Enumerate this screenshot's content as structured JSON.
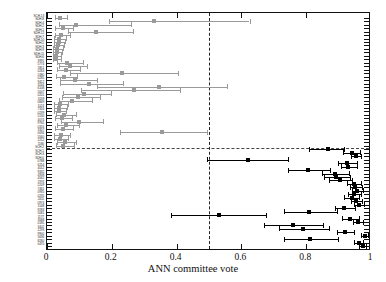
{
  "figure": {
    "xaxis": {
      "label": "ANN committee vote",
      "ticks": [
        "0",
        "0.2",
        "0.4",
        "0.6",
        "0.8",
        "1"
      ],
      "tick_values": [
        0,
        0.2,
        0.4,
        0.6,
        0.8,
        1.0
      ],
      "min": 0,
      "max": 1
    },
    "decision_threshold": 0.5,
    "group_split_fraction": 0.215,
    "colors": {
      "rejected_marker": "#9a9a9a",
      "accepted_marker": "#000000",
      "axis": "#111111",
      "reference_line": "#222222"
    }
  },
  "chart_data": {
    "type": "scatter",
    "title": "",
    "xlabel": "ANN committee vote",
    "ylabel": "",
    "xlim": [
      0,
      1
    ],
    "grid": false,
    "legend": "none",
    "orientation": "horizontal-forest",
    "annotations": [
      {
        "type": "vline",
        "x": 0.5,
        "style": "dashed",
        "label": "decision threshold"
      },
      {
        "type": "hline",
        "y_index": 13,
        "style": "dashed",
        "label": "group separator"
      }
    ],
    "series": [
      {
        "name": "Low vote (gray)",
        "color": "#9a9a9a",
        "marker": "square",
        "points": [
          {
            "label": "SCH-13",
            "x": 0.04,
            "xerr_low": 0.016,
            "xerr_high": 0.022
          },
          {
            "label": "SDH-8",
            "x": 0.33,
            "xerr_low": 0.14,
            "xerr_high": 0.295
          },
          {
            "label": "SDH-4",
            "x": 0.088,
            "xerr_low": 0.052,
            "xerr_high": 0.17
          },
          {
            "label": "SDH-2",
            "x": 0.05,
            "xerr_low": 0.026,
            "xerr_high": 0.03
          },
          {
            "label": "SDH-1",
            "x": 0.15,
            "xerr_low": 0.085,
            "xerr_high": 0.115
          },
          {
            "label": "SDH-12",
            "x": 0.044,
            "xerr_low": 0.02,
            "xerr_high": 0.026
          },
          {
            "label": "SDH-7",
            "x": 0.038,
            "xerr_low": 0.015,
            "xerr_high": 0.02
          },
          {
            "label": "SDH-10",
            "x": 0.036,
            "xerr_low": 0.014,
            "xerr_high": 0.019
          },
          {
            "label": "SDH-5",
            "x": 0.034,
            "xerr_low": 0.013,
            "xerr_high": 0.018
          },
          {
            "label": "SDH-3",
            "x": 0.032,
            "xerr_low": 0.012,
            "xerr_high": 0.017
          },
          {
            "label": "SDH-9",
            "x": 0.03,
            "xerr_low": 0.012,
            "xerr_high": 0.016
          },
          {
            "label": "SDH-11",
            "x": 0.029,
            "xerr_low": 0.011,
            "xerr_high": 0.015
          },
          {
            "label": "SDH-6",
            "x": 0.028,
            "xerr_low": 0.011,
            "xerr_high": 0.015
          },
          {
            "label": "3991",
            "x": 0.062,
            "xerr_low": 0.03,
            "xerr_high": 0.048
          },
          {
            "label": "5774",
            "x": 0.07,
            "xerr_low": 0.034,
            "xerr_high": 0.052
          },
          {
            "label": "1851",
            "x": 0.058,
            "xerr_low": 0.028,
            "xerr_high": 0.044
          },
          {
            "label": "0263",
            "x": 0.23,
            "xerr_low": 0.16,
            "xerr_high": 0.175
          },
          {
            "label": "2480",
            "x": 0.054,
            "xerr_low": 0.026,
            "xerr_high": 0.04
          },
          {
            "label": "0285",
            "x": 0.085,
            "xerr_low": 0.046,
            "xerr_high": 0.07
          },
          {
            "label": "9412",
            "x": 0.13,
            "xerr_low": 0.09,
            "xerr_high": 0.105
          },
          {
            "label": "3244",
            "x": 0.345,
            "xerr_low": 0.19,
            "xerr_high": 0.21
          },
          {
            "label": "6108",
            "x": 0.27,
            "xerr_low": 0.165,
            "xerr_high": 0.14
          },
          {
            "label": "5007",
            "x": 0.115,
            "xerr_low": 0.065,
            "xerr_high": 0.082
          },
          {
            "label": "0201",
            "x": 0.095,
            "xerr_low": 0.05,
            "xerr_high": 0.07
          },
          {
            "label": "1059",
            "x": 0.078,
            "xerr_low": 0.04,
            "xerr_high": 0.062
          },
          {
            "label": "0849",
            "x": 0.04,
            "xerr_low": 0.018,
            "xerr_high": 0.026
          },
          {
            "label": "1024",
            "x": 0.038,
            "xerr_low": 0.016,
            "xerr_high": 0.024
          },
          {
            "label": "7316",
            "x": 0.036,
            "xerr_low": 0.015,
            "xerr_high": 0.022
          },
          {
            "label": "0239",
            "x": 0.052,
            "xerr_low": 0.024,
            "xerr_high": 0.036
          },
          {
            "label": "5130",
            "x": 0.046,
            "xerr_low": 0.021,
            "xerr_high": 0.03
          },
          {
            "label": "4074",
            "x": 0.1,
            "xerr_low": 0.056,
            "xerr_high": 0.074
          },
          {
            "label": "9765",
            "x": 0.058,
            "xerr_low": 0.027,
            "xerr_high": 0.04
          },
          {
            "label": "0316",
            "x": 0.048,
            "xerr_low": 0.022,
            "xerr_high": 0.032
          },
          {
            "label": "3357",
            "x": 0.355,
            "xerr_low": 0.13,
            "xerr_high": 0.14
          },
          {
            "label": "0094",
            "x": 0.042,
            "xerr_low": 0.019,
            "xerr_high": 0.028
          },
          {
            "label": "5560",
            "x": 0.04,
            "xerr_low": 0.018,
            "xerr_high": 0.026
          },
          {
            "label": "2212",
            "x": 0.055,
            "xerr_low": 0.025,
            "xerr_high": 0.036
          },
          {
            "label": "1180",
            "x": 0.05,
            "xerr_low": 0.023,
            "xerr_high": 0.032
          }
        ]
      },
      {
        "name": "High vote (black)",
        "color": "#000000",
        "marker": "square",
        "points": [
          {
            "label": "SCH-2",
            "x": 0.868,
            "xerr_low": 0.058,
            "xerr_high": 0.05
          },
          {
            "label": "SCH-1",
            "x": 0.942,
            "xerr_low": 0.028,
            "xerr_high": 0.024
          },
          {
            "label": "SCH-3",
            "x": 0.955,
            "xerr_low": 0.018,
            "xerr_high": 0.015
          },
          {
            "label": "SDH-0",
            "x": 0.62,
            "xerr_low": 0.125,
            "xerr_high": 0.125
          },
          {
            "label": "0788",
            "x": 0.926,
            "xerr_low": 0.028,
            "xerr_high": 0.03
          },
          {
            "label": "6254",
            "x": 0.93,
            "xerr_low": 0.024,
            "xerr_high": 0.026
          },
          {
            "label": "4012",
            "x": 0.805,
            "xerr_low": 0.06,
            "xerr_high": 0.068
          },
          {
            "label": "9332",
            "x": 0.888,
            "xerr_low": 0.04,
            "xerr_high": 0.044
          },
          {
            "label": "4908",
            "x": 0.892,
            "xerr_low": 0.038,
            "xerr_high": 0.042
          },
          {
            "label": "4562",
            "x": 0.905,
            "xerr_low": 0.034,
            "xerr_high": 0.036
          },
          {
            "label": "1976",
            "x": 0.946,
            "xerr_low": 0.02,
            "xerr_high": 0.022
          },
          {
            "label": "2209",
            "x": 0.952,
            "xerr_low": 0.018,
            "xerr_high": 0.019
          },
          {
            "label": "7461",
            "x": 0.958,
            "xerr_low": 0.016,
            "xerr_high": 0.017
          },
          {
            "label": "0935",
            "x": 0.948,
            "xerr_low": 0.019,
            "xerr_high": 0.021
          },
          {
            "label": "0235",
            "x": 0.94,
            "xerr_low": 0.022,
            "xerr_high": 0.024
          },
          {
            "label": "2411",
            "x": 0.955,
            "xerr_low": 0.017,
            "xerr_high": 0.018
          },
          {
            "label": "0974",
            "x": 0.962,
            "xerr_low": 0.014,
            "xerr_high": 0.015
          },
          {
            "label": "1548",
            "x": 0.918,
            "xerr_low": 0.03,
            "xerr_high": 0.032
          },
          {
            "label": "9283",
            "x": 0.81,
            "xerr_low": 0.08,
            "xerr_high": 0.085
          },
          {
            "label": "5081",
            "x": 0.532,
            "xerr_low": 0.15,
            "xerr_high": 0.145
          },
          {
            "label": "1177",
            "x": 0.935,
            "xerr_low": 0.026,
            "xerr_high": 0.027
          },
          {
            "label": "3068",
            "x": 0.96,
            "xerr_low": 0.015,
            "xerr_high": 0.016
          },
          {
            "label": "0185",
            "x": 0.76,
            "xerr_low": 0.09,
            "xerr_high": 0.092
          },
          {
            "label": "3402",
            "x": 0.79,
            "xerr_low": 0.075,
            "xerr_high": 0.08
          },
          {
            "label": "2293",
            "x": 0.92,
            "xerr_low": 0.026,
            "xerr_high": 0.028
          },
          {
            "label": "9900",
            "x": 0.98,
            "xerr_low": 0.01,
            "xerr_high": 0.01
          },
          {
            "label": "5636",
            "x": 0.812,
            "xerr_low": 0.082,
            "xerr_high": 0.086
          },
          {
            "label": "8280",
            "x": 0.962,
            "xerr_low": 0.013,
            "xerr_high": 0.014
          },
          {
            "label": "0470",
            "x": 0.974,
            "xerr_low": 0.01,
            "xerr_high": 0.011
          }
        ]
      }
    ]
  }
}
